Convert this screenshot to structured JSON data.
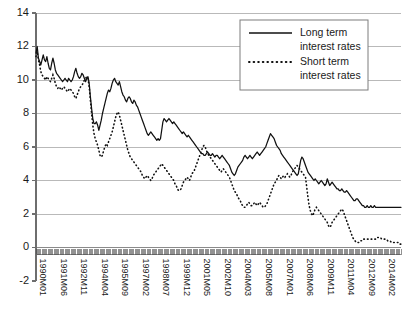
{
  "chart_data": {
    "type": "line",
    "title": "",
    "xlabel": "",
    "ylabel": "",
    "ylim": [
      -2,
      14
    ],
    "ytick_values": [
      -2,
      0,
      2,
      4,
      6,
      8,
      10,
      12,
      14
    ],
    "ytick_labels": [
      "-2",
      "0",
      "2",
      "4",
      "6",
      "8",
      "10",
      "12",
      "14"
    ],
    "grid": true,
    "legend_position": "top-right",
    "xtick_labels": [
      "1990M01",
      "1991M06",
      "1992M11",
      "1994M04",
      "1995M09",
      "1997M02",
      "1998M07",
      "1999M12",
      "2001M05",
      "2002M10",
      "2004M03",
      "2005M08",
      "2007M01",
      "2008M06",
      "2009M11",
      "2011M04",
      "2012M09",
      "2014M02"
    ],
    "xtick_stride_months": 17,
    "x_start": "1990M01",
    "x_end": "2015M03",
    "n_points": 303,
    "series": [
      {
        "name": "Long term interest rates",
        "style": "solid",
        "color": "#111111",
        "values": [
          11.6,
          12.0,
          11.3,
          11.1,
          10.9,
          11.2,
          11.5,
          11.2,
          11.1,
          11.4,
          11.0,
          10.7,
          10.6,
          11.0,
          11.3,
          11.0,
          10.6,
          10.4,
          10.3,
          10.2,
          10.1,
          10.0,
          9.9,
          10.0,
          10.1,
          10.0,
          9.9,
          10.1,
          10.0,
          9.9,
          10.0,
          10.2,
          10.5,
          10.7,
          10.4,
          10.2,
          10.1,
          10.2,
          10.4,
          10.3,
          10.1,
          9.9,
          10.1,
          10.2,
          9.8,
          9.0,
          8.3,
          7.7,
          7.4,
          7.4,
          7.5,
          7.3,
          7.0,
          7.3,
          7.6,
          8.0,
          8.3,
          8.6,
          8.9,
          9.2,
          9.4,
          9.3,
          9.5,
          9.8,
          10.0,
          10.1,
          9.9,
          9.8,
          9.7,
          9.9,
          9.6,
          9.3,
          9.1,
          9.0,
          8.8,
          8.7,
          8.9,
          9.0,
          8.9,
          8.7,
          8.6,
          8.8,
          8.7,
          8.5,
          8.4,
          8.2,
          8.0,
          7.8,
          7.6,
          7.4,
          7.2,
          7.0,
          6.8,
          6.7,
          6.8,
          6.9,
          6.8,
          6.7,
          6.6,
          6.5,
          6.4,
          6.5,
          6.4,
          6.5,
          7.0,
          7.5,
          7.7,
          7.6,
          7.5,
          7.6,
          7.7,
          7.6,
          7.5,
          7.4,
          7.5,
          7.4,
          7.3,
          7.2,
          7.1,
          7.0,
          6.9,
          6.8,
          6.9,
          6.8,
          6.7,
          6.6,
          6.7,
          6.6,
          6.5,
          6.4,
          6.3,
          6.2,
          6.1,
          6.0,
          5.9,
          5.8,
          5.7,
          5.6,
          5.6,
          5.5,
          5.5,
          5.6,
          5.7,
          5.6,
          5.5,
          5.5,
          5.6,
          5.5,
          5.4,
          5.5,
          5.5,
          5.4,
          5.3,
          5.4,
          5.5,
          5.4,
          5.3,
          5.2,
          5.1,
          5.0,
          4.9,
          4.7,
          4.5,
          4.4,
          4.3,
          4.4,
          4.6,
          4.8,
          4.9,
          5.0,
          5.1,
          5.2,
          5.4,
          5.5,
          5.4,
          5.3,
          5.4,
          5.5,
          5.4,
          5.3,
          5.4,
          5.5,
          5.6,
          5.7,
          5.6,
          5.5,
          5.6,
          5.7,
          5.8,
          5.9,
          6.0,
          6.2,
          6.4,
          6.6,
          6.8,
          6.7,
          6.6,
          6.5,
          6.3,
          6.1,
          6.0,
          5.9,
          5.8,
          5.6,
          5.5,
          5.4,
          5.3,
          5.2,
          5.1,
          5.0,
          4.9,
          4.8,
          4.7,
          4.6,
          4.5,
          4.4,
          4.3,
          4.4,
          4.8,
          5.2,
          5.4,
          5.3,
          5.1,
          4.9,
          4.7,
          4.5,
          4.4,
          4.3,
          4.2,
          4.1,
          4.0,
          4.1,
          4.0,
          3.9,
          3.8,
          3.9,
          4.0,
          3.9,
          3.8,
          3.7,
          3.8,
          4.1,
          3.9,
          3.7,
          3.8,
          3.9,
          3.8,
          3.7,
          3.6,
          3.5,
          3.5,
          3.4,
          3.4,
          3.5,
          3.4,
          3.3,
          3.3,
          3.4,
          3.3,
          3.2,
          3.1,
          3.0,
          2.9,
          2.8,
          2.8,
          2.9,
          2.9,
          2.8,
          2.7,
          2.6,
          2.5,
          2.5,
          2.4,
          2.4,
          2.5,
          2.4,
          2.4,
          2.5,
          2.4,
          2.4,
          2.5,
          2.4,
          2.4,
          2.4,
          2.4,
          2.4,
          2.4,
          2.4,
          2.4,
          2.4,
          2.4,
          2.4,
          2.4,
          2.4,
          2.4,
          2.4,
          2.4,
          2.4,
          2.4,
          2.4,
          2.4,
          2.4,
          2.4
        ]
      },
      {
        "name": "Short term interest rates",
        "style": "dotted",
        "color": "#111111",
        "values": [
          11.4,
          11.7,
          11.2,
          10.9,
          10.5,
          10.3,
          10.2,
          10.1,
          10.0,
          10.2,
          10.1,
          10.0,
          9.9,
          10.1,
          10.3,
          10.1,
          9.8,
          9.6,
          9.5,
          9.6,
          9.5,
          9.4,
          9.5,
          9.6,
          9.5,
          9.4,
          9.3,
          9.4,
          9.5,
          9.4,
          9.3,
          9.2,
          9.0,
          8.9,
          9.1,
          9.3,
          9.5,
          9.6,
          9.7,
          9.8,
          10.0,
          10.1,
          10.2,
          10.1,
          9.6,
          8.8,
          8.0,
          7.3,
          6.8,
          6.5,
          6.3,
          6.1,
          5.8,
          5.5,
          5.4,
          5.5,
          5.8,
          6.0,
          6.2,
          6.1,
          6.3,
          6.5,
          6.7,
          6.9,
          7.2,
          7.5,
          7.8,
          8.0,
          8.1,
          7.9,
          7.6,
          7.3,
          7.0,
          6.7,
          6.4,
          6.1,
          5.8,
          5.6,
          5.4,
          5.3,
          5.2,
          5.1,
          5.0,
          4.9,
          4.8,
          4.7,
          4.6,
          4.5,
          4.3,
          4.2,
          4.1,
          4.2,
          4.3,
          4.2,
          4.1,
          4.0,
          4.1,
          4.3,
          4.4,
          4.5,
          4.6,
          4.7,
          4.8,
          4.9,
          5.0,
          4.9,
          4.8,
          4.7,
          4.6,
          4.5,
          4.4,
          4.3,
          4.2,
          4.1,
          4.0,
          3.8,
          3.7,
          3.5,
          3.4,
          3.4,
          3.5,
          3.7,
          3.9,
          4.0,
          4.1,
          4.2,
          4.1,
          4.0,
          4.2,
          4.4,
          4.5,
          4.6,
          4.8,
          5.0,
          5.2,
          5.4,
          5.6,
          5.8,
          6.0,
          6.1,
          6.0,
          5.8,
          5.6,
          5.5,
          5.4,
          5.3,
          5.2,
          5.1,
          5.0,
          4.9,
          4.8,
          4.7,
          4.6,
          4.5,
          4.6,
          4.7,
          4.6,
          4.5,
          4.4,
          4.3,
          4.2,
          4.0,
          3.8,
          3.6,
          3.4,
          3.3,
          3.2,
          3.0,
          2.9,
          2.8,
          2.6,
          2.5,
          2.4,
          2.4,
          2.5,
          2.6,
          2.7,
          2.6,
          2.5,
          2.5,
          2.6,
          2.7,
          2.6,
          2.5,
          2.6,
          2.7,
          2.6,
          2.5,
          2.4,
          2.4,
          2.5,
          2.6,
          2.8,
          3.0,
          3.2,
          3.4,
          3.6,
          3.8,
          3.9,
          4.0,
          4.2,
          4.3,
          4.2,
          4.1,
          4.2,
          4.3,
          4.2,
          4.3,
          4.4,
          4.3,
          4.2,
          4.3,
          4.5,
          4.6,
          4.7,
          4.8,
          4.9,
          4.8,
          4.7,
          4.6,
          4.5,
          4.4,
          4.3,
          4.2,
          3.6,
          3.0,
          2.5,
          2.2,
          2.0,
          1.9,
          2.1,
          2.3,
          2.4,
          2.3,
          2.2,
          2.1,
          2.0,
          1.9,
          1.8,
          1.7,
          1.6,
          1.5,
          1.3,
          1.2,
          1.3,
          1.5,
          1.6,
          1.7,
          1.8,
          1.9,
          2.0,
          2.1,
          2.2,
          2.3,
          2.2,
          2.0,
          1.8,
          1.6,
          1.4,
          1.2,
          1.0,
          0.8,
          0.6,
          0.5,
          0.4,
          0.3,
          0.3,
          0.3,
          0.4,
          0.4,
          0.4,
          0.5,
          0.5,
          0.5,
          0.5,
          0.5,
          0.5,
          0.5,
          0.5,
          0.5,
          0.5,
          0.5,
          0.6,
          0.6,
          0.6,
          0.6,
          0.5,
          0.5,
          0.5,
          0.5,
          0.5,
          0.4,
          0.4,
          0.4,
          0.3,
          0.3,
          0.3,
          0.3,
          0.3,
          0.3,
          0.3,
          0.2,
          0.2
        ]
      }
    ]
  },
  "legend": {
    "entries": [
      {
        "label_line1": "Long term",
        "label_line2": "interest rates",
        "style": "solid"
      },
      {
        "label_line1": "Short term",
        "label_line2": "interest rates",
        "style": "dotted"
      }
    ]
  }
}
